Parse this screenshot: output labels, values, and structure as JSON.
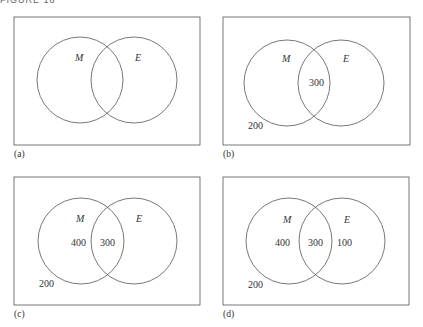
{
  "figure": {
    "title": "FIGURE 16",
    "set_labels": {
      "m": "M",
      "e": "E"
    },
    "panels": [
      {
        "id": "a",
        "label": "(a)",
        "outside": "",
        "m_only": "",
        "intersection": "",
        "e_only": ""
      },
      {
        "id": "b",
        "label": "(b)",
        "outside": "200",
        "m_only": "",
        "intersection": "300",
        "e_only": ""
      },
      {
        "id": "c",
        "label": "(c)",
        "outside": "200",
        "m_only": "400",
        "intersection": "300",
        "e_only": ""
      },
      {
        "id": "d",
        "label": "(d)",
        "outside": "200",
        "m_only": "400",
        "intersection": "300",
        "e_only": "100"
      }
    ]
  }
}
